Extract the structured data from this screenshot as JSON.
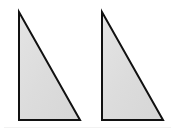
{
  "figure": {
    "canvas": {
      "width": 175,
      "height": 133,
      "background_color": "#ffffff"
    },
    "style": {
      "fill_color": "#dcdcdc",
      "fill_color_light": "#e6e6e6",
      "stroke_color": "#111111",
      "stroke_width": 2,
      "artifact_line_color": "#f2f2f2"
    },
    "shapes": [
      {
        "name": "left-triangle",
        "type": "right-triangle",
        "orientation": "right-angle-bottom-left",
        "points": "19,12 19,120 80,120",
        "vertices": {
          "apex": [
            19,
            12
          ],
          "bottom_left": [
            19,
            120
          ],
          "bottom_right": [
            80,
            120
          ]
        },
        "width": 61,
        "height": 108,
        "label": ""
      },
      {
        "name": "right-triangle",
        "type": "right-triangle",
        "orientation": "right-angle-bottom-left",
        "points": "102,12 102,120 163,120",
        "vertices": {
          "apex": [
            102,
            12
          ],
          "bottom_left": [
            102,
            120
          ],
          "bottom_right": [
            163,
            120
          ]
        },
        "width": 61,
        "height": 108,
        "label": ""
      }
    ]
  }
}
